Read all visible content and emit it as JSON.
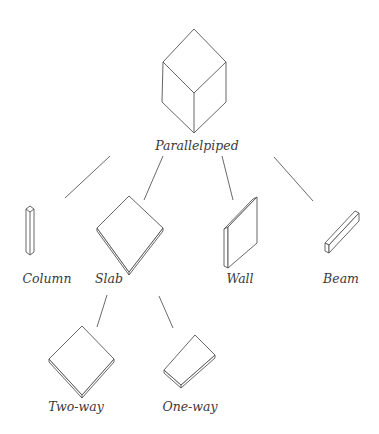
{
  "diagram": {
    "type": "taxonomy-tree",
    "root": {
      "id": "parallelpiped",
      "label": "Parallelpiped",
      "icon": "parallelepiped-cube-icon"
    },
    "children": [
      {
        "id": "column",
        "label": "Column",
        "icon": "column-prism-icon"
      },
      {
        "id": "slab",
        "label": "Slab",
        "icon": "slab-plate-icon",
        "children": [
          {
            "id": "two-way",
            "label": "Two-way",
            "icon": "two-way-slab-icon"
          },
          {
            "id": "one-way",
            "label": "One-way",
            "icon": "one-way-slab-icon"
          }
        ]
      },
      {
        "id": "wall",
        "label": "Wall",
        "icon": "wall-panel-icon"
      },
      {
        "id": "beam",
        "label": "Beam",
        "icon": "beam-bar-icon"
      }
    ],
    "colors": {
      "background": "#ffffff",
      "line": "#6a6a6a",
      "text": "#3a3a3a"
    }
  },
  "labels": {
    "root": "Parallelpiped",
    "column": "Column",
    "slab": "Slab",
    "wall": "Wall",
    "beam": "Beam",
    "two_way": "Two-way",
    "one_way": "One-way"
  }
}
